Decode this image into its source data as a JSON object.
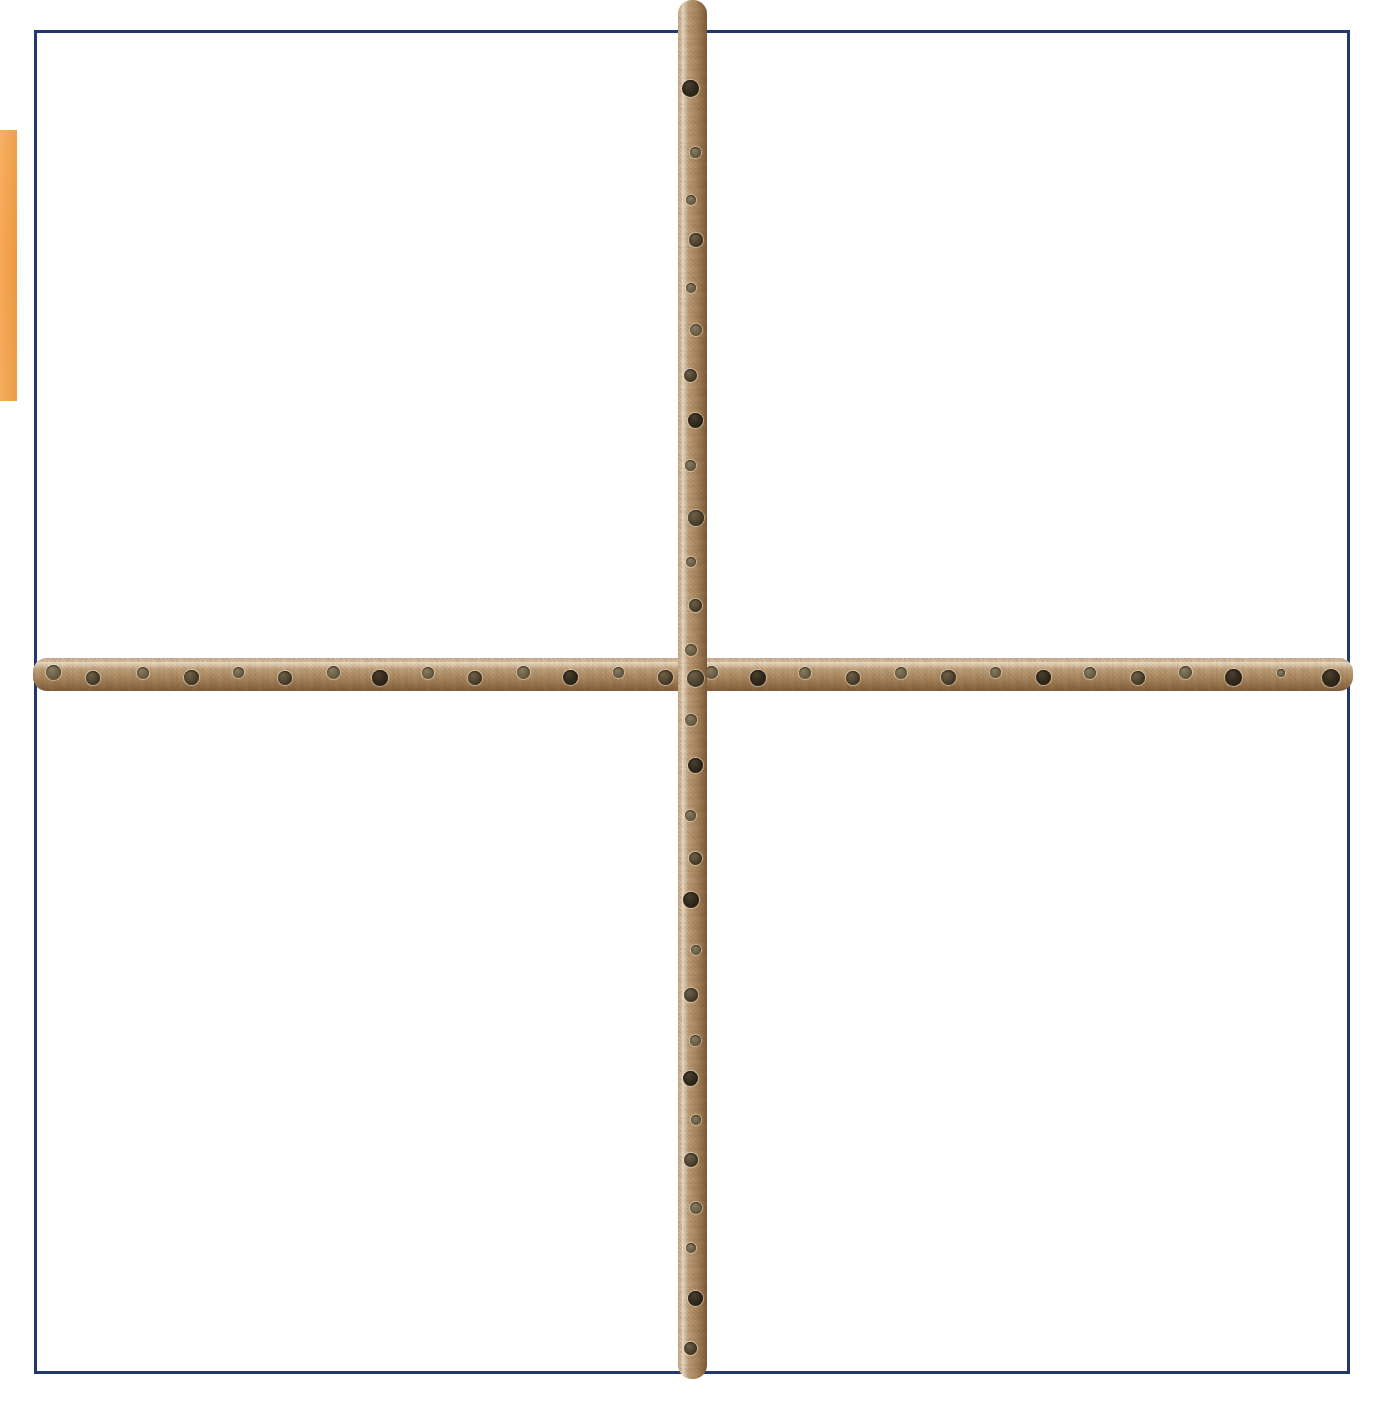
{
  "page": {
    "background_color": "#ffffff",
    "width": 1387,
    "height": 1414,
    "caption": ""
  },
  "frame": {
    "name": "page-border-rectangle",
    "color": "#22386d",
    "left": 34,
    "top": 30,
    "width": 1316,
    "height": 1344,
    "thickness": 3
  },
  "edge_tab": {
    "name": "orange-edge-tab",
    "color": "#f5a04a",
    "left": 0,
    "top": 130,
    "width": 17,
    "height": 271,
    "label": ""
  },
  "subject": {
    "description": "two perforated wooden dowel rods crossed in a plus shape",
    "material": "wood",
    "wood_light_color": "#d8c3a4",
    "wood_mid_color": "#b99a72",
    "wood_dark_color": "#7d5d3b",
    "hole_color": "#3c3323"
  },
  "rods": [
    {
      "id": "rod-horizontal",
      "name": "horizontal-dowel-rod",
      "orientation": "horizontal",
      "left": 33,
      "top": 658,
      "length": 1320,
      "thickness": 33,
      "hole_count": 28,
      "hole_spacing": 47,
      "holes": [
        {
          "pos": 20,
          "size": 15,
          "depth": "shallow"
        },
        {
          "pos": 60,
          "size": 14,
          "depth": "normal"
        },
        {
          "pos": 110,
          "size": 12,
          "depth": "shallow"
        },
        {
          "pos": 158,
          "size": 15,
          "depth": "normal"
        },
        {
          "pos": 205,
          "size": 11,
          "depth": "shallow"
        },
        {
          "pos": 252,
          "size": 14,
          "depth": "normal"
        },
        {
          "pos": 300,
          "size": 13,
          "depth": "shallow"
        },
        {
          "pos": 347,
          "size": 16,
          "depth": "deep"
        },
        {
          "pos": 395,
          "size": 12,
          "depth": "shallow"
        },
        {
          "pos": 442,
          "size": 14,
          "depth": "normal"
        },
        {
          "pos": 490,
          "size": 13,
          "depth": "shallow"
        },
        {
          "pos": 537,
          "size": 15,
          "depth": "deep"
        },
        {
          "pos": 585,
          "size": 11,
          "depth": "shallow"
        },
        {
          "pos": 632,
          "size": 15,
          "depth": "normal"
        },
        {
          "pos": 678,
          "size": 13,
          "depth": "shallow"
        },
        {
          "pos": 725,
          "size": 16,
          "depth": "deep"
        },
        {
          "pos": 772,
          "size": 12,
          "depth": "shallow"
        },
        {
          "pos": 820,
          "size": 14,
          "depth": "normal"
        },
        {
          "pos": 868,
          "size": 12,
          "depth": "shallow"
        },
        {
          "pos": 915,
          "size": 15,
          "depth": "normal"
        },
        {
          "pos": 962,
          "size": 11,
          "depth": "shallow"
        },
        {
          "pos": 1010,
          "size": 15,
          "depth": "deep"
        },
        {
          "pos": 1057,
          "size": 12,
          "depth": "shallow"
        },
        {
          "pos": 1105,
          "size": 14,
          "depth": "normal"
        },
        {
          "pos": 1152,
          "size": 13,
          "depth": "shallow"
        },
        {
          "pos": 1200,
          "size": 17,
          "depth": "deep"
        },
        {
          "pos": 1248,
          "size": 8,
          "depth": "shallow"
        },
        {
          "pos": 1298,
          "size": 18,
          "depth": "deep"
        }
      ]
    },
    {
      "id": "rod-vertical",
      "name": "vertical-dowel-rod",
      "orientation": "vertical",
      "left": 678,
      "top": 0,
      "length": 1379,
      "thickness": 29,
      "hole_count": 29,
      "hole_spacing": 47,
      "holes": [
        {
          "pos": 88,
          "size": 17,
          "depth": "deep"
        },
        {
          "pos": 152,
          "size": 11,
          "depth": "shallow"
        },
        {
          "pos": 200,
          "size": 10,
          "depth": "shallow"
        },
        {
          "pos": 240,
          "size": 14,
          "depth": "normal"
        },
        {
          "pos": 288,
          "size": 10,
          "depth": "shallow"
        },
        {
          "pos": 330,
          "size": 12,
          "depth": "shallow"
        },
        {
          "pos": 375,
          "size": 13,
          "depth": "normal"
        },
        {
          "pos": 420,
          "size": 15,
          "depth": "deep"
        },
        {
          "pos": 465,
          "size": 11,
          "depth": "shallow"
        },
        {
          "pos": 518,
          "size": 16,
          "depth": "normal"
        },
        {
          "pos": 562,
          "size": 10,
          "depth": "shallow"
        },
        {
          "pos": 605,
          "size": 13,
          "depth": "normal"
        },
        {
          "pos": 650,
          "size": 12,
          "depth": "shallow"
        },
        {
          "pos": 678,
          "size": 17,
          "depth": "normal"
        },
        {
          "pos": 720,
          "size": 12,
          "depth": "shallow"
        },
        {
          "pos": 765,
          "size": 15,
          "depth": "deep"
        },
        {
          "pos": 815,
          "size": 11,
          "depth": "shallow"
        },
        {
          "pos": 858,
          "size": 13,
          "depth": "normal"
        },
        {
          "pos": 900,
          "size": 16,
          "depth": "deep"
        },
        {
          "pos": 950,
          "size": 10,
          "depth": "shallow"
        },
        {
          "pos": 995,
          "size": 14,
          "depth": "normal"
        },
        {
          "pos": 1040,
          "size": 11,
          "depth": "shallow"
        },
        {
          "pos": 1078,
          "size": 15,
          "depth": "deep"
        },
        {
          "pos": 1120,
          "size": 10,
          "depth": "shallow"
        },
        {
          "pos": 1160,
          "size": 14,
          "depth": "normal"
        },
        {
          "pos": 1208,
          "size": 12,
          "depth": "shallow"
        },
        {
          "pos": 1248,
          "size": 10,
          "depth": "shallow"
        },
        {
          "pos": 1298,
          "size": 15,
          "depth": "deep"
        },
        {
          "pos": 1348,
          "size": 13,
          "depth": "normal"
        }
      ]
    }
  ]
}
